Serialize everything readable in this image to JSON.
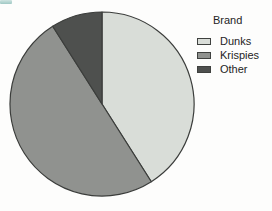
{
  "legend": {
    "title": "Brand",
    "items": [
      {
        "label": "Dunks",
        "color": "#d9ddd8"
      },
      {
        "label": "Krispies",
        "color": "#90928f"
      },
      {
        "label": "Other",
        "color": "#4e504e"
      }
    ]
  },
  "chart_data": {
    "type": "pie",
    "title": "",
    "legend_title": "Brand",
    "legend_position": "upper right",
    "categories": [
      "Dunks",
      "Krispies",
      "Other"
    ],
    "values": [
      41,
      50,
      9
    ],
    "unit": "percent (estimated from slice angles)",
    "angles_deg": [
      147,
      180,
      33
    ],
    "start_reference": "top",
    "direction": "clockwise",
    "colors": [
      "#d9ddd8",
      "#90928f",
      "#4e504e"
    ],
    "stroke": "#3b3d3b"
  },
  "artifact": {
    "description": "teal scan mark top-left",
    "color": "#a7cdc8"
  }
}
